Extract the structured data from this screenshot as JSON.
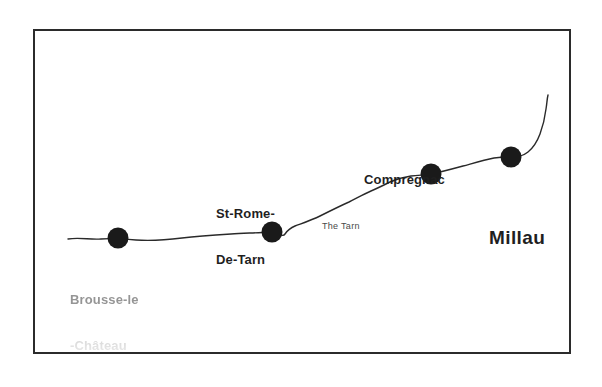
{
  "figure": {
    "background_color": "#ffffff",
    "frame_color": "#2b2b2b",
    "ink_color": "#1a1a1a"
  },
  "river": {
    "name_label": "The Tarn",
    "label_x": 322,
    "label_y": 221,
    "stroke_color": "#2a2a2a",
    "path": "M 68,239 C 80,237 90,240 101,239 C 112,238 124,239 136,240 C 150,241 166,240 182,238 C 198,236 214,235 231,234 C 244,233 258,233 268,232 C 272,231.5 276,231 279,233 C 281,234.5 283,237 285,234 C 287,231 290,228 295,226 C 303,223 312,220 320,216 C 330,211 340,206 349,202 C 357,198 364,194 371,191 C 378,188 384,185 390,182 C 397,179 404,177 411,176 C 419,175 426,175 431,174 C 441,172 452,169 463,166 C 474,163 484,160 494,158 C 501,157 507,157 512,157 C 518,157 523,156 528,152 C 533,148 537,142 540,134 C 543,126 545,117 546,109 C 547,103 547,99 548,95"
  },
  "cities": [
    {
      "id": "brousse-le-chateau",
      "name": "Brousse-le-Château",
      "label_lines": [
        "Brousse-le",
        "-Château"
      ],
      "label_style": "town",
      "label_faded": true,
      "label_x": 70,
      "label_y": 261,
      "dot_x": 118,
      "dot_y": 238,
      "dot_size": 21
    },
    {
      "id": "st-rome-de-tarn",
      "name": "St-Rome-De-Tarn",
      "label_lines": [
        "St-Rome-",
        "De-Tarn"
      ],
      "label_style": "town",
      "label_faded": false,
      "label_x": 216,
      "label_y": 175,
      "dot_x": 272,
      "dot_y": 232,
      "dot_size": 21
    },
    {
      "id": "compregnac",
      "name": "Compregnac",
      "label_lines": [
        "Compregnac"
      ],
      "label_style": "town",
      "label_faded": false,
      "label_x": 364,
      "label_y": 141,
      "dot_x": 431,
      "dot_y": 174,
      "dot_size": 21
    },
    {
      "id": "millau",
      "name": "Millau",
      "label_lines": [
        "Millau"
      ],
      "label_style": "city",
      "label_faded": false,
      "label_x": 489,
      "label_y": 182,
      "dot_x": 511,
      "dot_y": 157,
      "dot_size": 21
    }
  ]
}
